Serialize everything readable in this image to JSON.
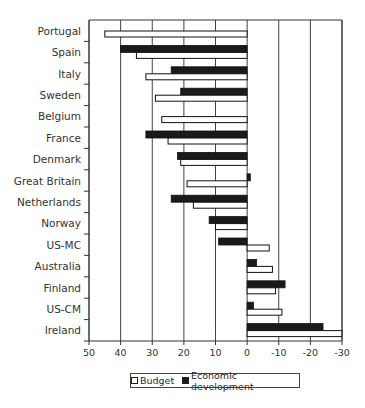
{
  "chart_data": {
    "type": "bar",
    "orientation": "horizontal",
    "title": "",
    "xlabel": "",
    "ylabel": "",
    "xlim": [
      50,
      -30
    ],
    "x_reversed": true,
    "xticks": [
      50,
      40,
      30,
      20,
      10,
      0,
      -10,
      -20,
      -30
    ],
    "xtick_labels": [
      "50",
      "40",
      "30",
      "20",
      "10",
      "0",
      "-10",
      "-20",
      "-30"
    ],
    "grid": "vertical",
    "legend_position": "bottom",
    "categories": [
      "Portugal",
      "Spain",
      "Italy",
      "Sweden",
      "Belgium",
      "France",
      "Denmark",
      "Great Britain",
      "Netherlands",
      "Norway",
      "US-MC",
      "Australia",
      "Finland",
      "US-CM",
      "Ireland"
    ],
    "series": [
      {
        "name": "Economic development",
        "color": "#1a1a1a",
        "values": [
          null,
          40,
          24,
          21,
          null,
          32,
          22,
          -1,
          24,
          12,
          9,
          -3,
          -12,
          -2,
          -24
        ]
      },
      {
        "name": "Budget",
        "color": "#ffffff",
        "values": [
          45,
          35,
          32,
          29,
          27,
          25,
          21,
          19,
          17,
          10,
          -7,
          -8,
          -9,
          -11,
          -30
        ]
      }
    ]
  },
  "legend": {
    "budget_label": "Budget",
    "econ_label": "Economic development"
  }
}
